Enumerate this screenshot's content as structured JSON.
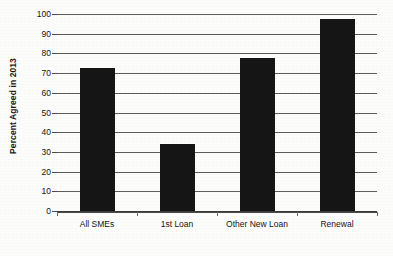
{
  "chart_data": {
    "type": "bar",
    "title": "",
    "subtitle": "",
    "xlabel": "",
    "ylabel": "Percent Agreed in 2013",
    "categories": [
      "All SMEs",
      "1st Loan",
      "Other New Loan",
      "Renewal"
    ],
    "values": [
      72.5,
      34,
      77.5,
      97.5
    ],
    "ylim": [
      0,
      100
    ],
    "ytick_labels": [
      "0",
      "10",
      "20",
      "30",
      "40",
      "50",
      "60",
      "70",
      "80",
      "90",
      "100"
    ],
    "ytick_values": [
      0,
      10,
      20,
      30,
      40,
      50,
      60,
      70,
      80,
      90,
      100
    ],
    "grid": "horizontal",
    "legend": "none",
    "bar_color": "#161616",
    "grid_color": "#5d5d5d",
    "background_color": "#fdfdfb",
    "axis_color": "#4a4a4a"
  }
}
